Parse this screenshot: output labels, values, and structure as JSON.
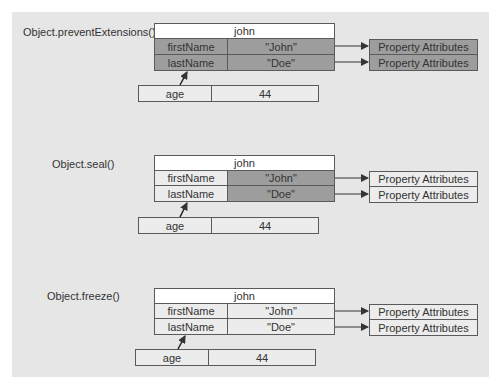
{
  "sections": [
    {
      "label": "Object.preventExtensions()",
      "object": {
        "name": "john",
        "rows": [
          {
            "key": "firstName",
            "value": "\"John\""
          },
          {
            "key": "lastName",
            "value": "\"Doe\""
          }
        ]
      },
      "attributes": [
        "Property Attributes",
        "Property Attributes"
      ],
      "new_property": {
        "key": "age",
        "value": "44"
      },
      "shading": {
        "key": "dark",
        "value": "dark",
        "attributes": "dark"
      }
    },
    {
      "label": "Object.seal()",
      "object": {
        "name": "john",
        "rows": [
          {
            "key": "firstName",
            "value": "\"John\""
          },
          {
            "key": "lastName",
            "value": "\"Doe\""
          }
        ]
      },
      "attributes": [
        "Property Attributes",
        "Property Attributes"
      ],
      "new_property": {
        "key": "age",
        "value": "44"
      },
      "shading": {
        "key": "light",
        "value": "dark",
        "attributes": "light"
      }
    },
    {
      "label": "Object.freeze()",
      "object": {
        "name": "john",
        "rows": [
          {
            "key": "firstName",
            "value": "\"John\""
          },
          {
            "key": "lastName",
            "value": "\"Doe\""
          }
        ]
      },
      "attributes": [
        "Property Attributes",
        "Property Attributes"
      ],
      "new_property": {
        "key": "age",
        "value": "44"
      },
      "shading": {
        "key": "light",
        "value": "light",
        "attributes": "light"
      }
    }
  ],
  "colors": {
    "panel": "#e6e6e6",
    "header": "#ffffff",
    "light_cell": "#ececec",
    "dark_cell": "#9d9d9d",
    "border": "#5a5a5a"
  }
}
